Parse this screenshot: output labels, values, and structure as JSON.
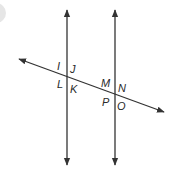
{
  "diagram": {
    "line_color": "#333333",
    "labels": {
      "I": "I",
      "J": "J",
      "L": "L",
      "K": "K",
      "M": "M",
      "N": "N",
      "P": "P",
      "O": "O"
    }
  }
}
